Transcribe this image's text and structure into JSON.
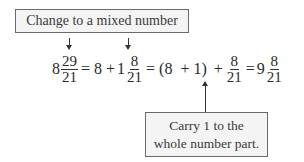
{
  "top_callout": {
    "text": "Change to a mixed number"
  },
  "bottom_callout": {
    "line1": "Carry 1 to the",
    "line2": "whole number part."
  },
  "equation": {
    "term1": {
      "whole": "8",
      "num": "29",
      "den": "21"
    },
    "eq1": "=",
    "term2_whole": "8",
    "plus1": "+",
    "term3": {
      "whole": "1",
      "num": "8",
      "den": "21"
    },
    "eq2": "=",
    "group": "(8  + 1)",
    "plus2": "+",
    "term4": {
      "num": "8",
      "den": "21"
    },
    "eq3": "=",
    "result": {
      "whole": "9",
      "num": "8",
      "den": "21"
    }
  }
}
